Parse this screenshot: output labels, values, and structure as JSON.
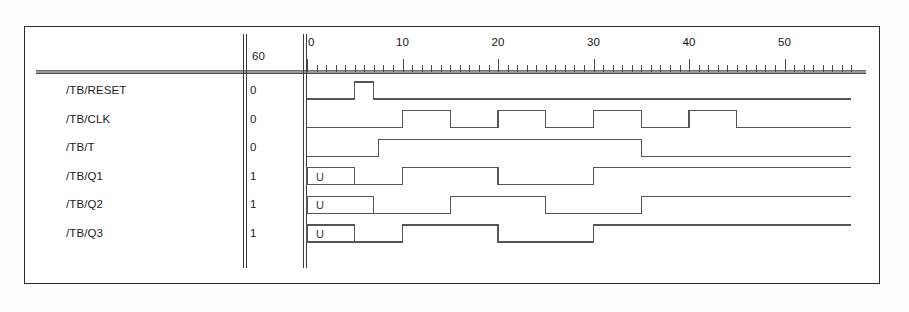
{
  "window": {
    "title": "Wave Viewer"
  },
  "cursor": {
    "label": "60"
  },
  "ruler": {
    "unit_px": 9.55,
    "origin_px": 4,
    "t_start": 0,
    "t_end": 57,
    "major_interval": 10,
    "minor_interval": 1,
    "labels": [
      {
        "t": 0,
        "text": "0"
      },
      {
        "t": 10,
        "text": "10"
      },
      {
        "t": 20,
        "text": "20"
      },
      {
        "t": 30,
        "text": "30"
      },
      {
        "t": 40,
        "text": "40"
      },
      {
        "t": 50,
        "text": "50"
      }
    ]
  },
  "signals": [
    {
      "name": "/TB/RESET",
      "value": "0",
      "segments": [
        {
          "type": "level",
          "from": 0,
          "to": 5,
          "level": 0
        },
        {
          "type": "level",
          "from": 5,
          "to": 7,
          "level": 1
        },
        {
          "type": "level",
          "from": 7,
          "to": 57,
          "level": 0
        }
      ]
    },
    {
      "name": "/TB/CLK",
      "value": "0",
      "segments": [
        {
          "type": "level",
          "from": 0,
          "to": 10,
          "level": 0
        },
        {
          "type": "level",
          "from": 10,
          "to": 15,
          "level": 1
        },
        {
          "type": "level",
          "from": 15,
          "to": 20,
          "level": 0
        },
        {
          "type": "level",
          "from": 20,
          "to": 25,
          "level": 1
        },
        {
          "type": "level",
          "from": 25,
          "to": 30,
          "level": 0
        },
        {
          "type": "level",
          "from": 30,
          "to": 35,
          "level": 1
        },
        {
          "type": "level",
          "from": 35,
          "to": 40,
          "level": 0
        },
        {
          "type": "level",
          "from": 40,
          "to": 45,
          "level": 1
        },
        {
          "type": "level",
          "from": 45,
          "to": 57,
          "level": 0
        }
      ]
    },
    {
      "name": "/TB/T",
      "value": "0",
      "segments": [
        {
          "type": "level",
          "from": 0,
          "to": 7.5,
          "level": 0
        },
        {
          "type": "level",
          "from": 7.5,
          "to": 35,
          "level": 1
        },
        {
          "type": "level",
          "from": 35,
          "to": 57,
          "level": 0
        }
      ]
    },
    {
      "name": "/TB/Q1",
      "value": "1",
      "segments": [
        {
          "type": "unknown",
          "from": 0,
          "to": 5,
          "text": "U"
        },
        {
          "type": "level",
          "from": 5,
          "to": 10,
          "level": 0
        },
        {
          "type": "level",
          "from": 10,
          "to": 20,
          "level": 1
        },
        {
          "type": "level",
          "from": 20,
          "to": 30,
          "level": 0
        },
        {
          "type": "level",
          "from": 30,
          "to": 57,
          "level": 1
        }
      ]
    },
    {
      "name": "/TB/Q2",
      "value": "1",
      "segments": [
        {
          "type": "unknown",
          "from": 0,
          "to": 7,
          "text": "U"
        },
        {
          "type": "level",
          "from": 7,
          "to": 15,
          "level": 0
        },
        {
          "type": "level",
          "from": 15,
          "to": 25,
          "level": 1
        },
        {
          "type": "level",
          "from": 25,
          "to": 35,
          "level": 0
        },
        {
          "type": "level",
          "from": 35,
          "to": 57,
          "level": 1
        }
      ]
    },
    {
      "name": "/TB/Q3",
      "value": "1",
      "segments": [
        {
          "type": "unknown",
          "from": 0,
          "to": 5,
          "text": "U"
        },
        {
          "type": "level",
          "from": 5,
          "to": 10,
          "level": 0
        },
        {
          "type": "level",
          "from": 10,
          "to": 20,
          "level": 1
        },
        {
          "type": "level",
          "from": 20,
          "to": 30,
          "level": 0
        },
        {
          "type": "level",
          "from": 30,
          "to": 57,
          "level": 1
        }
      ]
    }
  ],
  "colors": {
    "wave_stroke": "#555555",
    "rule": "#3a3a3a",
    "text": "#1c1c1c",
    "frame": "#2b2b2b",
    "background": "#ffffff"
  },
  "chart_data": {
    "type": "line",
    "xlabel": "time",
    "ylabel": "",
    "xlim": [
      0,
      57
    ],
    "x_ticks": [
      0,
      10,
      20,
      30,
      40,
      50
    ],
    "grid": false,
    "legend": "none",
    "series": [
      {
        "name": "/TB/RESET",
        "type": "digital",
        "transitions": [
          [
            0,
            0
          ],
          [
            5,
            1
          ],
          [
            7,
            0
          ],
          [
            57,
            0
          ]
        ]
      },
      {
        "name": "/TB/CLK",
        "type": "digital",
        "transitions": [
          [
            0,
            0
          ],
          [
            10,
            1
          ],
          [
            15,
            0
          ],
          [
            20,
            1
          ],
          [
            25,
            0
          ],
          [
            30,
            1
          ],
          [
            35,
            0
          ],
          [
            40,
            1
          ],
          [
            45,
            0
          ],
          [
            57,
            0
          ]
        ]
      },
      {
        "name": "/TB/T",
        "type": "digital",
        "transitions": [
          [
            0,
            0
          ],
          [
            7.5,
            1
          ],
          [
            35,
            0
          ],
          [
            57,
            0
          ]
        ]
      },
      {
        "name": "/TB/Q1",
        "type": "digital",
        "transitions": [
          [
            0,
            "U"
          ],
          [
            5,
            0
          ],
          [
            10,
            1
          ],
          [
            20,
            0
          ],
          [
            30,
            1
          ],
          [
            57,
            1
          ]
        ]
      },
      {
        "name": "/TB/Q2",
        "type": "digital",
        "transitions": [
          [
            0,
            "U"
          ],
          [
            7,
            0
          ],
          [
            15,
            1
          ],
          [
            25,
            0
          ],
          [
            35,
            1
          ],
          [
            57,
            1
          ]
        ]
      },
      {
        "name": "/TB/Q3",
        "type": "digital",
        "transitions": [
          [
            0,
            "U"
          ],
          [
            5,
            0
          ],
          [
            10,
            1
          ],
          [
            20,
            0
          ],
          [
            30,
            1
          ],
          [
            57,
            1
          ]
        ]
      }
    ]
  }
}
